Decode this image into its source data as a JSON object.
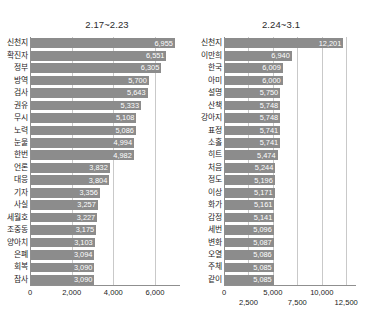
{
  "chart_data": [
    {
      "type": "bar",
      "orientation": "horizontal",
      "title": "2.17~2.23",
      "xlabel": "",
      "ylabel": "",
      "xlim": [
        0,
        7200
      ],
      "grid": true,
      "legend": "none",
      "bar_color": "#8c8c8c",
      "xticks": [
        0,
        2000,
        4000,
        6000
      ],
      "xtick_labels": [
        "0",
        "2,000",
        "4,000",
        "6,000"
      ],
      "categories": [
        "신천지",
        "확진자",
        "정부",
        "방역",
        "검사",
        "권유",
        "무시",
        "노력",
        "눈물",
        "한번",
        "언론",
        "대응",
        "기자",
        "사실",
        "세월호",
        "조중동",
        "양아치",
        "은폐",
        "회복",
        "참사"
      ],
      "values": [
        6955,
        6551,
        6305,
        5700,
        5643,
        5333,
        5108,
        5086,
        4994,
        4982,
        3832,
        3804,
        3356,
        3257,
        3227,
        3175,
        3103,
        3094,
        3090,
        3090
      ],
      "value_labels": [
        "6,955",
        "6,551",
        "6,305",
        "5,700",
        "5,643",
        "5,333",
        "5,108",
        "5,086",
        "4,994",
        "4,982",
        "3,832",
        "3,804",
        "3,356",
        "3,257",
        "3,227",
        "3,175",
        "3,103",
        "3,094",
        "3,090",
        "3,090"
      ]
    },
    {
      "type": "bar",
      "orientation": "horizontal",
      "title": "2.24~3.1",
      "xlabel": "",
      "ylabel": "",
      "xlim": [
        0,
        13500
      ],
      "grid": true,
      "legend": "none",
      "bar_color": "#8c8c8c",
      "xticks": [
        0,
        2500,
        5000,
        7500,
        10000,
        12500
      ],
      "xtick_labels": [
        "0",
        "2,500",
        "5,000",
        "7,500",
        "10,000",
        "12,500"
      ],
      "categories": [
        "신천지",
        "이만희",
        "한국",
        "아미",
        "설명",
        "산책",
        "강아지",
        "표정",
        "소홀",
        "히트",
        "처음",
        "정도",
        "이상",
        "화가",
        "감정",
        "세번",
        "변화",
        "오열",
        "주체",
        "같이"
      ],
      "values": [
        12201,
        6940,
        6009,
        6000,
        5750,
        5748,
        5748,
        5741,
        5741,
        5474,
        5244,
        5196,
        5171,
        5161,
        5141,
        5096,
        5087,
        5086,
        5085,
        5085
      ],
      "value_labels": [
        "12,201",
        "6,940",
        "6,009",
        "6,000",
        "5,750",
        "5,748",
        "5,748",
        "5,741",
        "5,741",
        "5,474",
        "5,244",
        "5,196",
        "5,171",
        "5,161",
        "5,141",
        "5,096",
        "5,087",
        "5,086",
        "5,085",
        "5,085"
      ]
    }
  ]
}
